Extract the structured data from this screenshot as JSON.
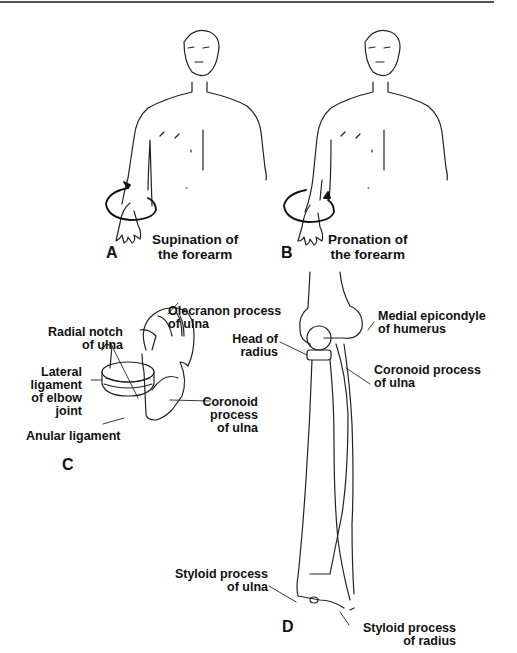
{
  "figure": {
    "panels": [
      {
        "id": "A",
        "caption_line1": "Supination of",
        "caption_line2": "the forearm"
      },
      {
        "id": "B",
        "caption_line1": "Pronation of",
        "caption_line2": "the forearm"
      },
      {
        "id": "C",
        "labels": {
          "olecranon_1": "Olecranon process",
          "olecranon_2": "of ulna",
          "radial_notch_1": "Radial notch",
          "radial_notch_2": "of ulna",
          "lateral_1": "Lateral",
          "lateral_2": "ligament",
          "lateral_3": "of elbow",
          "lateral_4": "joint",
          "anular": "Anular ligament",
          "coronoid_1": "Coronoid",
          "coronoid_2": "process",
          "coronoid_3": "of ulna"
        }
      },
      {
        "id": "D",
        "labels": {
          "head_1": "Head of",
          "head_2": "radius",
          "medial_1": "Medial epicondyle",
          "medial_2": "of humerus",
          "coronoid_1": "Coronoid process",
          "coronoid_2": "of ulna",
          "styloid_ulna_1": "Styloid process",
          "styloid_ulna_2": "of ulna",
          "styloid_radius_1": "Styloid process",
          "styloid_radius_2": "of radius"
        }
      }
    ]
  }
}
